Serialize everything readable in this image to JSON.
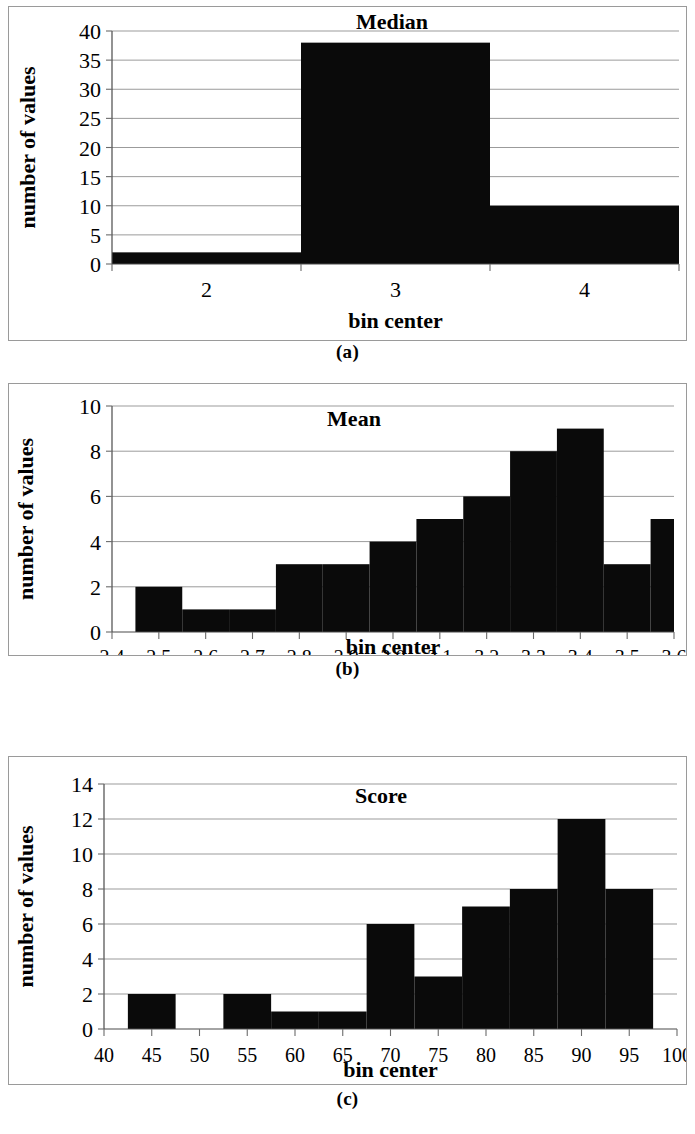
{
  "figure": {
    "captions": [
      "(a)",
      "(b)",
      "(c)"
    ],
    "common_ylabel": "number of values",
    "common_xlabel": "bin center"
  },
  "chart_data": [
    {
      "type": "bar",
      "title": "Median",
      "xlabel": "bin center",
      "ylabel": "number of values",
      "categories": [
        "2",
        "3",
        "4"
      ],
      "values": [
        2,
        38,
        10
      ],
      "yticks": [
        0,
        5,
        10,
        15,
        20,
        25,
        30,
        35,
        40
      ],
      "ylim": [
        0,
        40
      ],
      "grid": true,
      "legend": "none",
      "bar_color": "#0a0a0a"
    },
    {
      "type": "bar",
      "title": "Mean",
      "xlabel": "bin center",
      "ylabel": "number of values",
      "categories": [
        "2.4",
        "2.5",
        "2.6",
        "2.7",
        "2.8",
        "2.9",
        "3.0",
        "3.1",
        "3.2",
        "3.3",
        "3.4",
        "3.5",
        "3.6"
      ],
      "values": [
        0,
        2,
        1,
        1,
        3,
        3,
        4,
        5,
        6,
        8,
        9,
        3,
        5
      ],
      "yticks": [
        0,
        2,
        4,
        6,
        8,
        10
      ],
      "ylim": [
        0,
        10
      ],
      "grid": true,
      "legend": "none",
      "bar_color": "#0a0a0a"
    },
    {
      "type": "bar",
      "title": "Score",
      "xlabel": "bin center",
      "ylabel": "number of values",
      "categories": [
        "40",
        "45",
        "50",
        "55",
        "60",
        "65",
        "70",
        "75",
        "80",
        "85",
        "90",
        "95",
        "100"
      ],
      "values": [
        0,
        2,
        0,
        2,
        1,
        1,
        6,
        3,
        7,
        8,
        12,
        8,
        0
      ],
      "yticks": [
        0,
        2,
        4,
        6,
        8,
        10,
        12,
        14
      ],
      "ylim": [
        0,
        14
      ],
      "grid": true,
      "legend": "none",
      "bar_color": "#0a0a0a"
    }
  ]
}
